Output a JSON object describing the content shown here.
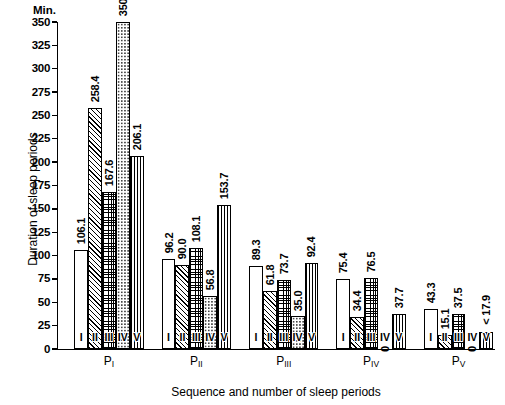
{
  "chart_data": {
    "type": "bar",
    "title": "",
    "unit_label": "Min.",
    "xlabel": "Sequence and number of sleep periods",
    "ylabel": "Duration of sleep periods",
    "ylim": [
      0,
      350
    ],
    "ytick_step": 25,
    "yticks": [
      0,
      25,
      50,
      75,
      100,
      125,
      150,
      175,
      200,
      225,
      250,
      275,
      300,
      325,
      350
    ],
    "ytick_labels": [
      "0",
      "25",
      "50",
      "75",
      "100",
      "125",
      "150",
      "175",
      "200",
      "225",
      "250",
      "275",
      "300",
      "325",
      "350"
    ],
    "grid": false,
    "legend": "none",
    "categories": [
      "I",
      "II",
      "III",
      "IV",
      "V"
    ],
    "groups": [
      {
        "name": "P_I",
        "label_main": "P",
        "label_sub": "I",
        "bars": [
          {
            "category": "I",
            "value": 106.1,
            "label": "106.1",
            "pattern": "plain"
          },
          {
            "category": "II",
            "value": 258.4,
            "label": "258.4",
            "pattern": "diagonal-hatch"
          },
          {
            "category": "III",
            "value": 167.6,
            "label": "167.6",
            "pattern": "cross-hatch"
          },
          {
            "category": "IV",
            "value": 350.2,
            "label": "350.2",
            "pattern": "dotted"
          },
          {
            "category": "V",
            "value": 206.1,
            "label": "206.1",
            "pattern": "vertical-lines"
          }
        ]
      },
      {
        "name": "P_II",
        "label_main": "P",
        "label_sub": "II",
        "bars": [
          {
            "category": "I",
            "value": 96.2,
            "label": "96.2",
            "pattern": "plain"
          },
          {
            "category": "II",
            "value": 90.0,
            "label": "90.0",
            "pattern": "diagonal-hatch"
          },
          {
            "category": "III",
            "value": 108.1,
            "label": "108.1",
            "pattern": "cross-hatch"
          },
          {
            "category": "IV",
            "value": 56.8,
            "label": "56.8",
            "pattern": "dotted"
          },
          {
            "category": "V",
            "value": 153.7,
            "label": "153.7",
            "pattern": "vertical-lines"
          }
        ]
      },
      {
        "name": "P_III",
        "label_main": "P",
        "label_sub": "III",
        "bars": [
          {
            "category": "I",
            "value": 89.3,
            "label": "89.3",
            "pattern": "plain"
          },
          {
            "category": "II",
            "value": 61.8,
            "label": "61.8",
            "pattern": "diagonal-hatch"
          },
          {
            "category": "III",
            "value": 73.7,
            "label": "73.7",
            "pattern": "cross-hatch"
          },
          {
            "category": "IV",
            "value": 35.0,
            "label": "35.0",
            "pattern": "dotted"
          },
          {
            "category": "V",
            "value": 92.4,
            "label": "92.4",
            "pattern": "vertical-lines"
          }
        ]
      },
      {
        "name": "P_IV",
        "label_main": "P",
        "label_sub": "IV",
        "bars": [
          {
            "category": "I",
            "value": 75.4,
            "label": "75.4",
            "pattern": "plain"
          },
          {
            "category": "II",
            "value": 34.4,
            "label": "34.4",
            "pattern": "diagonal-hatch"
          },
          {
            "category": "III",
            "value": 76.5,
            "label": "76.5",
            "pattern": "cross-hatch"
          },
          {
            "category": "IV",
            "value": 0,
            "label": "0",
            "pattern": "dotted"
          },
          {
            "category": "V",
            "value": 37.7,
            "label": "37.7",
            "pattern": "vertical-lines"
          }
        ]
      },
      {
        "name": "P_V",
        "label_main": "P",
        "label_sub": "V",
        "bars": [
          {
            "category": "I",
            "value": 43.3,
            "label": "43.3",
            "pattern": "plain"
          },
          {
            "category": "II",
            "value": 15.1,
            "label": "15.1",
            "pattern": "diagonal-hatch"
          },
          {
            "category": "III",
            "value": 37.5,
            "label": "37.5",
            "pattern": "cross-hatch"
          },
          {
            "category": "IV",
            "value": 0,
            "label": "0",
            "pattern": "dotted"
          },
          {
            "category": "V",
            "value": 17.9,
            "label": "< 17.9",
            "pattern": "vertical-lines"
          }
        ]
      }
    ]
  },
  "colors": {
    "ink": "#000000",
    "background": "#ffffff"
  }
}
